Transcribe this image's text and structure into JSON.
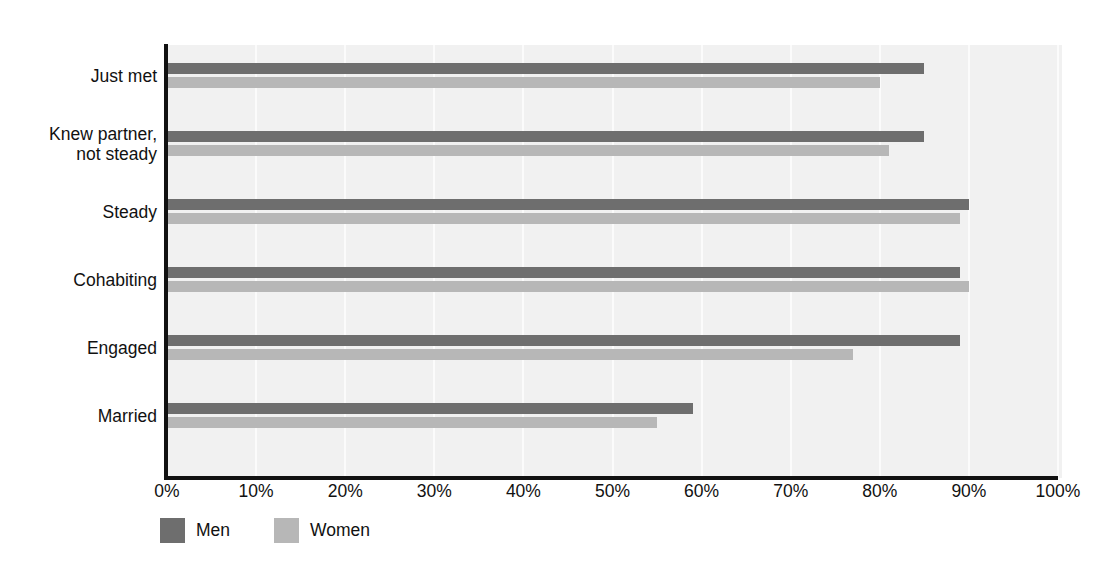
{
  "chart_data": {
    "type": "bar",
    "orientation": "horizontal",
    "title": "",
    "subtitle": "",
    "xlabel": "",
    "ylabel": "",
    "xlim": [
      0,
      100
    ],
    "xticks": [
      0,
      10,
      20,
      30,
      40,
      50,
      60,
      70,
      80,
      90,
      100
    ],
    "xticklabels": [
      "0%",
      "10%",
      "20%",
      "30%",
      "40%",
      "50%",
      "60%",
      "70%",
      "80%",
      "90%",
      "100%"
    ],
    "grid": "vertical",
    "legend_position": "bottom-left",
    "categories": [
      "Just met",
      "Knew partner,\nnot steady",
      "Steady",
      "Cohabiting",
      "Engaged",
      "Married"
    ],
    "series": [
      {
        "name": "Men",
        "color": "#6e6e6e",
        "values": [
          85,
          85,
          90,
          89,
          89,
          59
        ]
      },
      {
        "name": "Women",
        "color": "#b7b7b7",
        "values": [
          80,
          81,
          89,
          90,
          77,
          55
        ]
      }
    ]
  },
  "legend": {
    "entries": [
      {
        "label": "Men",
        "color": "#6e6e6e"
      },
      {
        "label": "Women",
        "color": "#b7b7b7"
      }
    ]
  },
  "colors": {
    "men": "#6e6e6e",
    "women": "#b7b7b7",
    "plot_background": "#f1f1f1",
    "gridline": "#fbfbfb",
    "axis": "#111111",
    "page_background": "#ffffff"
  }
}
